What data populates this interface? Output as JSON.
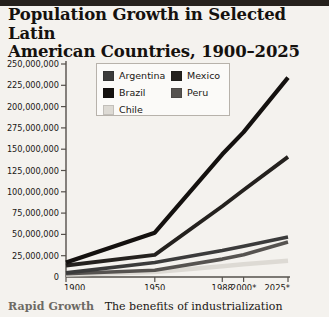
{
  "title": "Population Growth in Selected Latin\nAmerican Countries, 1900–2025",
  "caption": {
    "lead": "Rapid Growth",
    "text": "The benefits of industrialization"
  },
  "legend": {
    "position": "top-center-inside",
    "left_column": [
      {
        "label": "Argentina",
        "color": "#3b3b3b"
      },
      {
        "label": "Brazil",
        "color": "#14110f"
      },
      {
        "label": "Chile",
        "color": "#dddad4"
      }
    ],
    "right_column": [
      {
        "label": "Mexico",
        "color": "#24211e"
      },
      {
        "label": "Peru",
        "color": "#565350"
      }
    ]
  },
  "axis": {
    "y_ticks": [
      "250,000,000",
      "225,000,000",
      "200,000,000",
      "275,000,000",
      "150,000,000",
      "125,000,000",
      "100,000,000",
      "75,000,000",
      "50,000,000",
      "25,000,000",
      "0"
    ],
    "x_ticks": [
      "1900",
      "1950",
      "1988",
      "2000*",
      "2025*"
    ]
  },
  "chart_data": {
    "type": "line",
    "title": "Population Growth in Selected Latin American Countries, 1900–2025",
    "xlabel": "",
    "ylabel": "",
    "x": [
      "1900",
      "1950",
      "1988",
      "2000*",
      "2025*"
    ],
    "x_positions": [
      0,
      0.5,
      0.88,
      1.0,
      1.25
    ],
    "ylim": [
      0,
      250000000
    ],
    "ytick_values": [
      250000000,
      225000000,
      200000000,
      175000000,
      150000000,
      125000000,
      100000000,
      75000000,
      50000000,
      25000000,
      0
    ],
    "ytick_labels_as_printed": [
      "250,000,000",
      "225,000,000",
      "200,000,000",
      "275,000,000",
      "150,000,000",
      "125,000,000",
      "100,000,000",
      "75,000,000",
      "50,000,000",
      "25,000,000",
      "0"
    ],
    "grid": false,
    "legend_position": "upper center",
    "note": "The fourth y-axis tick is printed as 275,000,000 in the source graphic; by position it represents 175,000,000.",
    "series": [
      {
        "name": "Brazil",
        "color": "#14110f",
        "values": [
          17000000,
          52000000,
          144000000,
          170000000,
          234000000
        ]
      },
      {
        "name": "Mexico",
        "color": "#24211e",
        "values": [
          13500000,
          26000000,
          83000000,
          102000000,
          141000000
        ]
      },
      {
        "name": "Argentina",
        "color": "#3b3b3b",
        "values": [
          4800000,
          17000000,
          31000000,
          36000000,
          47000000
        ]
      },
      {
        "name": "Peru",
        "color": "#565350",
        "values": [
          3800000,
          8000000,
          21000000,
          26000000,
          41000000
        ]
      },
      {
        "name": "Chile",
        "color": "#dddad4",
        "values": [
          3000000,
          6000000,
          12500000,
          15000000,
          19000000
        ]
      }
    ]
  }
}
